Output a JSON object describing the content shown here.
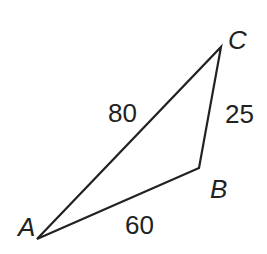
{
  "diagram": {
    "type": "triangle",
    "vertices": [
      "A",
      "B",
      "C"
    ],
    "sides": [
      {
        "between": [
          "A",
          "C"
        ],
        "length": "80"
      },
      {
        "between": [
          "B",
          "C"
        ],
        "length": "25"
      },
      {
        "between": [
          "A",
          "B"
        ],
        "length": "60"
      }
    ],
    "labels": {
      "A": "A",
      "B": "B",
      "C": "C",
      "AC": "80",
      "BC": "25",
      "AB": "60"
    },
    "stroke_color": "#222222"
  }
}
